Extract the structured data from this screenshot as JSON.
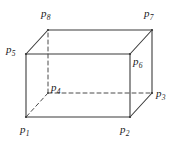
{
  "figure": {
    "type": "line-drawing",
    "canvas": {
      "width": 175,
      "height": 146
    },
    "colors": {
      "background": "#ffffff",
      "solid_edge": "#3b3b3b",
      "hidden_edge": "#4a4a4a",
      "label_text": "#1a1a1a"
    },
    "stroke_widths": {
      "solid": 1.1,
      "hidden": 1.0
    },
    "hidden_edge_dash": "4,3",
    "vertices": [
      {
        "id": "p1",
        "letter": "p",
        "subscript": "1",
        "x": 26,
        "y": 117,
        "hidden": false,
        "label_x": 20,
        "label_y": 124
      },
      {
        "id": "p2",
        "letter": "p",
        "subscript": "2",
        "x": 130,
        "y": 117,
        "hidden": false,
        "label_x": 120,
        "label_y": 124
      },
      {
        "id": "p3",
        "letter": "p",
        "subscript": "3",
        "x": 152,
        "y": 93,
        "hidden": false,
        "label_x": 156,
        "label_y": 88
      },
      {
        "id": "p4",
        "letter": "p",
        "subscript": "4",
        "x": 48,
        "y": 93,
        "hidden": true,
        "label_x": 51,
        "label_y": 82
      },
      {
        "id": "p5",
        "letter": "p",
        "subscript": "5",
        "x": 26,
        "y": 54,
        "hidden": false,
        "label_x": 6,
        "label_y": 44
      },
      {
        "id": "p6",
        "letter": "p",
        "subscript": "6",
        "x": 130,
        "y": 54,
        "hidden": false,
        "label_x": 133,
        "label_y": 56
      },
      {
        "id": "p7",
        "letter": "p",
        "subscript": "7",
        "x": 152,
        "y": 30,
        "hidden": false,
        "label_x": 144,
        "label_y": 8
      },
      {
        "id": "p8",
        "letter": "p",
        "subscript": "8",
        "x": 48,
        "y": 30,
        "hidden": false,
        "label_x": 41,
        "label_y": 8
      }
    ],
    "edges": [
      {
        "id": "p1-p2",
        "from": "p1",
        "to": "p2",
        "style": "solid"
      },
      {
        "id": "p2-p6",
        "from": "p2",
        "to": "p6",
        "style": "solid"
      },
      {
        "id": "p6-p5",
        "from": "p6",
        "to": "p5",
        "style": "solid"
      },
      {
        "id": "p5-p1",
        "from": "p5",
        "to": "p1",
        "style": "solid"
      },
      {
        "id": "p8-p7",
        "from": "p8",
        "to": "p7",
        "style": "solid"
      },
      {
        "id": "p7-p3",
        "from": "p7",
        "to": "p3",
        "style": "solid"
      },
      {
        "id": "p5-p8",
        "from": "p5",
        "to": "p8",
        "style": "solid"
      },
      {
        "id": "p6-p7",
        "from": "p6",
        "to": "p7",
        "style": "solid"
      },
      {
        "id": "p2-p3",
        "from": "p2",
        "to": "p3",
        "style": "solid"
      },
      {
        "id": "p4-p8",
        "from": "p4",
        "to": "p8",
        "style": "dashed"
      },
      {
        "id": "p4-p3",
        "from": "p4",
        "to": "p3",
        "style": "dashed"
      },
      {
        "id": "p4-p1",
        "from": "p4",
        "to": "p1",
        "style": "dashed"
      }
    ]
  }
}
